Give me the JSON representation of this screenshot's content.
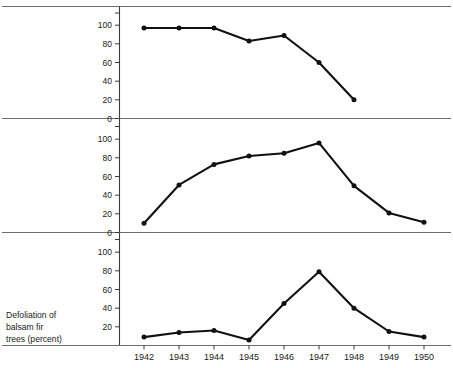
{
  "chart_data": {
    "type": "line",
    "title": "",
    "xlabel": "",
    "ylabel": "Defoliation of balsam fir trees (percent)",
    "ylabel_lines": [
      "Defoliation of",
      "balsam fir",
      "trees (percent)"
    ],
    "grid": false,
    "legend": "none",
    "panels_layout": "three stacked panels sharing one x-axis",
    "x": [
      1942,
      1943,
      1944,
      1945,
      1946,
      1947,
      1948,
      1949,
      1950
    ],
    "xtick_labels": [
      "1942",
      "1943",
      "1944",
      "1945",
      "1946",
      "1947",
      "1948",
      "1949",
      "1950"
    ],
    "xlim": [
      1941.5,
      1950.6
    ],
    "ylim": [
      0,
      115
    ],
    "panels": [
      {
        "name": "panel-top",
        "ytick_labels": [
          "0",
          "20",
          "40",
          "60",
          "80",
          "100"
        ],
        "yticks": [
          0,
          20,
          40,
          60,
          80,
          100
        ],
        "ylim": [
          0,
          115
        ],
        "x": [
          1942,
          1943,
          1944,
          1945,
          1946,
          1947,
          1948
        ],
        "values": [
          97,
          97,
          97,
          83,
          89,
          60,
          20
        ]
      },
      {
        "name": "panel-middle",
        "ytick_labels": [
          "0",
          "20",
          "40",
          "60",
          "80",
          "100"
        ],
        "yticks": [
          0,
          20,
          40,
          60,
          80,
          100
        ],
        "ylim": [
          0,
          115
        ],
        "x": [
          1942,
          1943,
          1944,
          1945,
          1946,
          1947,
          1948,
          1949,
          1950
        ],
        "values": [
          10,
          51,
          73,
          82,
          85,
          96,
          50,
          21,
          11
        ]
      },
      {
        "name": "panel-bottom",
        "ytick_labels": [
          "20",
          "40",
          "60",
          "80",
          "100"
        ],
        "yticks": [
          20,
          40,
          60,
          80,
          100
        ],
        "ylim": [
          0,
          115
        ],
        "x": [
          1942,
          1943,
          1944,
          1945,
          1946,
          1947,
          1948,
          1949,
          1950
        ],
        "values": [
          9,
          14,
          16,
          6,
          45,
          79,
          40,
          15,
          9
        ]
      }
    ],
    "colors": {
      "line": "#111111",
      "marker": "#111111",
      "axis": "#3b3b3b",
      "rule": "#6e6e6e",
      "background": "#ffffff",
      "text": "#1a1a1a"
    }
  }
}
